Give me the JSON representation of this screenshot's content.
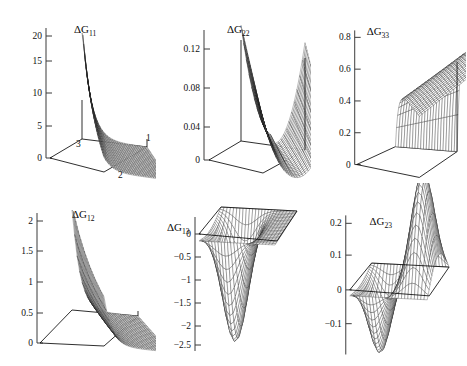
{
  "figure": {
    "title": "",
    "background_color": "#ffffff",
    "line_color": "#1a1a1a",
    "rows": 2,
    "columns": 3
  },
  "chart_data": [
    {
      "type": "surface",
      "id": "dG11",
      "title": "ΔG",
      "title_subscript": "11",
      "xlabel": "",
      "ylabel": "",
      "zlabel": "",
      "zticks": [
        0,
        5,
        10,
        15,
        20
      ],
      "ztick_labels": [
        "0",
        "5",
        "10",
        "15",
        "20"
      ],
      "zlim": [
        0,
        23
      ],
      "corner_labels": [
        "1",
        "2",
        "3"
      ],
      "grid": true,
      "legend": "none",
      "surface_peak": 23,
      "surface_min": 0,
      "shape": "steep ridge rising at one corner, decaying to flat valley",
      "nu": 26,
      "nv": 26
    },
    {
      "type": "surface",
      "id": "dG22",
      "title": "ΔG",
      "title_subscript": "22",
      "xlabel": "",
      "ylabel": "",
      "zlabel": "",
      "zticks": [
        0,
        0.04,
        0.08,
        0.12
      ],
      "ztick_labels": [
        "0",
        "0.04",
        "0.08",
        "0.12"
      ],
      "zlim": [
        0,
        0.135
      ],
      "corner_labels": [],
      "grid": true,
      "legend": "none",
      "surface_peak": 0.132,
      "surface_min": 0,
      "shape": "saddle/valley between two raised opposite corners",
      "nu": 24,
      "nv": 24
    },
    {
      "type": "surface",
      "id": "dG33",
      "title": "ΔG",
      "title_subscript": "33",
      "xlabel": "",
      "ylabel": "",
      "zlabel": "",
      "zticks": [
        0,
        0.2,
        0.4,
        0.6,
        0.8
      ],
      "ztick_labels": [
        "0",
        "0.2",
        "0.4",
        "0.6",
        "0.8"
      ],
      "zlim": [
        0,
        0.86
      ],
      "corner_labels": [],
      "grid": true,
      "legend": "none",
      "surface_peak": 0.85,
      "surface_min": 0,
      "shape": "broad steep wall rising to plateau along one edge",
      "nu": 22,
      "nv": 22
    },
    {
      "type": "surface",
      "id": "dG12",
      "title": "ΔG",
      "title_subscript": "12",
      "xlabel": "",
      "ylabel": "",
      "zlabel": "",
      "zticks": [
        0,
        0.5,
        1,
        1.5,
        2
      ],
      "ztick_labels": [
        "0",
        "0.5",
        "1",
        "1.5",
        "2"
      ],
      "zlim": [
        0,
        2.3
      ],
      "corner_labels": [],
      "grid": true,
      "legend": "none",
      "surface_peak": 2.3,
      "surface_min": 0,
      "shape": "steep narrow ridge decaying into shallow basin with contours",
      "nu": 26,
      "nv": 26
    },
    {
      "type": "surface",
      "id": "dG13",
      "title": "ΔG",
      "title_subscript": "13",
      "xlabel": "",
      "ylabel": "",
      "zlabel": "",
      "zticks": [
        0,
        -0.5,
        -1,
        -1.5,
        -2,
        -2.5
      ],
      "ztick_labels": [
        "0",
        "−0.5",
        "−1",
        "−1.5",
        "−2",
        "−2.5"
      ],
      "zlim": [
        -2.6,
        0.1
      ],
      "corner_labels": [],
      "grid": true,
      "legend": "none",
      "surface_peak": 0,
      "surface_min": -2.5,
      "shape": "deep negative funnel dipping below the zero plane",
      "nu": 24,
      "nv": 24
    },
    {
      "type": "surface",
      "id": "dG23",
      "title": "ΔG",
      "title_subscript": "23",
      "xlabel": "",
      "ylabel": "",
      "zlabel": "",
      "zticks": [
        -0.1,
        0,
        0.1,
        0.2
      ],
      "ztick_labels": [
        "−0.1",
        "0",
        "0.1",
        "0.2"
      ],
      "zlim": [
        -0.16,
        0.23
      ],
      "corner_labels": [],
      "grid": true,
      "legend": "none",
      "surface_peak": 0.22,
      "surface_min": -0.14,
      "shape": "antisymmetric saddle with negative trough and positive crest",
      "nu": 24,
      "nv": 24
    }
  ]
}
